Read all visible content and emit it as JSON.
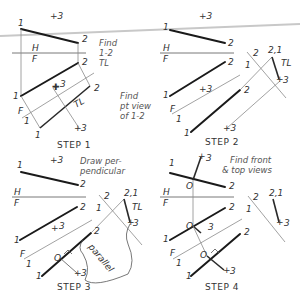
{
  "steps": [
    {
      "label": "STEP 1",
      "note_lines": [
        "Find",
        "1-2",
        "TL"
      ],
      "labels": {
        "p1_top": "1",
        "p2_top": "2",
        "p3_top": "+3",
        "H": "H",
        "F": "F",
        "p2_front": "2",
        "p1_front": "1",
        "p3_front": "3",
        "F1": "F",
        "one": "1",
        "p2_aux": "2",
        "p1_aux": "1",
        "p3_aux": "3",
        "TL": "TL"
      }
    },
    {
      "label": "STEP 2",
      "note_lines": [
        "Find",
        "pt view",
        "of 1-2"
      ],
      "labels": {
        "p1_top": "1",
        "p2_top": "2",
        "p3_top": "+3",
        "H": "H",
        "F": "F",
        "p2_front": "2",
        "p1_front": "1",
        "p3_front": "+3",
        "F1": "F",
        "one": "1",
        "p2_aux": "2",
        "p1_aux": "1",
        "p3_aux": "+3",
        "p2_sec": "2",
        "p1_sec": "1",
        "p21": "2,1",
        "p3_sec": "3",
        "TL": "TL"
      }
    },
    {
      "label": "STEP 3",
      "note_lines": [
        "Draw per-",
        "pendicular"
      ],
      "labels": {
        "p1_top": "1",
        "p2_top": "2",
        "p3_top": "+3",
        "H": "H",
        "F": "F",
        "p2_front": "2",
        "p1_front": "1",
        "p3_front": "3",
        "F1": "F",
        "one": "1",
        "p2_aux": "2",
        "p1_aux": "1",
        "p3_aux": "3",
        "O": "O",
        "p2_sec": "2",
        "p1_sec": "1",
        "p21": "2,1",
        "p3_sec": "3",
        "TL": "TL",
        "parallel": "parallel"
      }
    },
    {
      "label": "STEP 4",
      "note_lines": [
        "Find front",
        "& top views"
      ],
      "labels": {
        "p1_top": "1",
        "p2_top": "2",
        "p3_top": "3",
        "O_top": "O",
        "H": "H",
        "F": "F",
        "p2_front": "2",
        "p1_front": "1",
        "p3_front": "3",
        "O_front": "O",
        "F1": "F",
        "one": "1",
        "p2_aux": "2",
        "p1_aux": "1",
        "p3_aux": "3",
        "O_aux": "O",
        "p2_sec": "2",
        "p1_sec": "1",
        "p21": "2,1",
        "p3_sec": "3"
      }
    }
  ]
}
